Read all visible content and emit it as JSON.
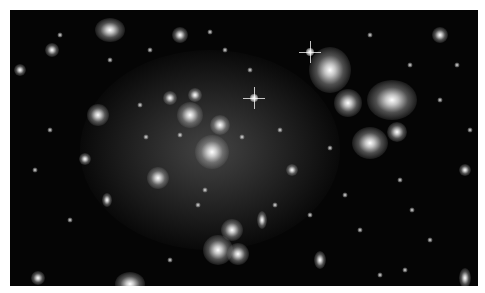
{
  "image": {
    "description": "Deep-field astronomical photograph of a galaxy cluster with diffuse intracluster light",
    "frame": {
      "x": 10,
      "y": 10,
      "width": 468,
      "height": 276
    },
    "background_color": "#050505",
    "halo": {
      "x": 70,
      "y": 40,
      "w": 260,
      "h": 200
    },
    "stars": [
      {
        "x": 300,
        "y": 42
      },
      {
        "x": 244,
        "y": 88
      }
    ],
    "galaxies": [
      {
        "x": 100,
        "y": 20,
        "w": 30,
        "h": 24
      },
      {
        "x": 170,
        "y": 25,
        "w": 16,
        "h": 16
      },
      {
        "x": 320,
        "y": 60,
        "w": 42,
        "h": 46
      },
      {
        "x": 382,
        "y": 90,
        "w": 50,
        "h": 40
      },
      {
        "x": 338,
        "y": 93,
        "w": 28,
        "h": 28
      },
      {
        "x": 360,
        "y": 133,
        "w": 36,
        "h": 32
      },
      {
        "x": 387,
        "y": 122,
        "w": 20,
        "h": 20
      },
      {
        "x": 430,
        "y": 25,
        "w": 16,
        "h": 16
      },
      {
        "x": 88,
        "y": 105,
        "w": 22,
        "h": 22
      },
      {
        "x": 202,
        "y": 142,
        "w": 34,
        "h": 34
      },
      {
        "x": 180,
        "y": 105,
        "w": 26,
        "h": 26
      },
      {
        "x": 210,
        "y": 115,
        "w": 20,
        "h": 20
      },
      {
        "x": 160,
        "y": 88,
        "w": 14,
        "h": 14
      },
      {
        "x": 185,
        "y": 85,
        "w": 14,
        "h": 14
      },
      {
        "x": 148,
        "y": 168,
        "w": 22,
        "h": 22
      },
      {
        "x": 222,
        "y": 220,
        "w": 22,
        "h": 22
      },
      {
        "x": 208,
        "y": 240,
        "w": 30,
        "h": 30
      },
      {
        "x": 228,
        "y": 244,
        "w": 22,
        "h": 22
      },
      {
        "x": 120,
        "y": 274,
        "w": 30,
        "h": 24
      },
      {
        "x": 282,
        "y": 160,
        "w": 12,
        "h": 12
      },
      {
        "x": 455,
        "y": 160,
        "w": 12,
        "h": 12
      },
      {
        "x": 10,
        "y": 60,
        "w": 12,
        "h": 12
      },
      {
        "x": 42,
        "y": 40,
        "w": 14,
        "h": 14
      },
      {
        "x": 75,
        "y": 149,
        "w": 12,
        "h": 12
      },
      {
        "x": 252,
        "y": 210,
        "w": 10,
        "h": 18
      },
      {
        "x": 310,
        "y": 250,
        "w": 12,
        "h": 18
      },
      {
        "x": 455,
        "y": 268,
        "w": 12,
        "h": 20
      },
      {
        "x": 28,
        "y": 268,
        "w": 14,
        "h": 14
      },
      {
        "x": 97,
        "y": 190,
        "w": 10,
        "h": 14
      }
    ],
    "dots": [
      {
        "x": 50,
        "y": 25
      },
      {
        "x": 200,
        "y": 22
      },
      {
        "x": 140,
        "y": 40
      },
      {
        "x": 215,
        "y": 40
      },
      {
        "x": 400,
        "y": 55
      },
      {
        "x": 447,
        "y": 55
      },
      {
        "x": 130,
        "y": 95
      },
      {
        "x": 136,
        "y": 127
      },
      {
        "x": 170,
        "y": 125
      },
      {
        "x": 232,
        "y": 127
      },
      {
        "x": 195,
        "y": 180
      },
      {
        "x": 188,
        "y": 195
      },
      {
        "x": 265,
        "y": 195
      },
      {
        "x": 335,
        "y": 185
      },
      {
        "x": 350,
        "y": 220
      },
      {
        "x": 402,
        "y": 200
      },
      {
        "x": 420,
        "y": 230
      },
      {
        "x": 60,
        "y": 210
      },
      {
        "x": 40,
        "y": 120
      },
      {
        "x": 25,
        "y": 160
      },
      {
        "x": 300,
        "y": 205
      },
      {
        "x": 370,
        "y": 265
      },
      {
        "x": 395,
        "y": 260
      },
      {
        "x": 160,
        "y": 250
      },
      {
        "x": 270,
        "y": 120
      },
      {
        "x": 430,
        "y": 90
      },
      {
        "x": 460,
        "y": 120
      },
      {
        "x": 100,
        "y": 50
      },
      {
        "x": 240,
        "y": 60
      },
      {
        "x": 360,
        "y": 25
      },
      {
        "x": 320,
        "y": 138
      },
      {
        "x": 390,
        "y": 170
      }
    ]
  }
}
